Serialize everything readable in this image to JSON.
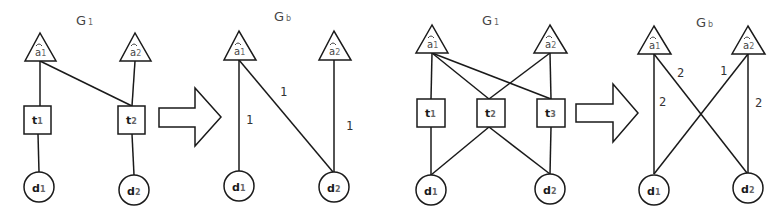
{
  "panels": [
    {
      "title": "G",
      "title_sub": "1",
      "aspects": [
        {
          "label": "a",
          "sub": "1"
        },
        {
          "label": "a",
          "sub": "2"
        }
      ],
      "terms": [
        {
          "label": "t",
          "sub": "1"
        },
        {
          "label": "t",
          "sub": "2"
        }
      ],
      "docs": [
        {
          "label": "d",
          "sub": "1"
        },
        {
          "label": "d",
          "sub": "2"
        }
      ],
      "edges": [
        [
          "a1",
          "t1"
        ],
        [
          "a1",
          "t2"
        ],
        [
          "a2",
          "t2"
        ],
        [
          "t1",
          "d1"
        ],
        [
          "t2",
          "d2"
        ]
      ]
    },
    {
      "title": "G",
      "title_sub": "b",
      "aspects": [
        {
          "label": "a",
          "sub": "1"
        },
        {
          "label": "a",
          "sub": "2"
        }
      ],
      "docs": [
        {
          "label": "d",
          "sub": "1"
        },
        {
          "label": "d",
          "sub": "2"
        }
      ],
      "edges": [
        {
          "from": "a1",
          "to": "d1",
          "weight": "1"
        },
        {
          "from": "a1",
          "to": "d2",
          "weight": "1"
        },
        {
          "from": "a2",
          "to": "d2",
          "weight": "1"
        }
      ]
    },
    {
      "title": "G",
      "title_sub": "1",
      "aspects": [
        {
          "label": "a",
          "sub": "1"
        },
        {
          "label": "a",
          "sub": "2"
        }
      ],
      "terms": [
        {
          "label": "t",
          "sub": "1"
        },
        {
          "label": "t",
          "sub": "2"
        },
        {
          "label": "t",
          "sub": "3"
        }
      ],
      "docs": [
        {
          "label": "d",
          "sub": "1"
        },
        {
          "label": "d",
          "sub": "2"
        }
      ],
      "edges": [
        [
          "a1",
          "t1"
        ],
        [
          "a1",
          "t2"
        ],
        [
          "a1",
          "t3"
        ],
        [
          "a2",
          "t2"
        ],
        [
          "a2",
          "t3"
        ],
        [
          "t1",
          "d1"
        ],
        [
          "t2",
          "d1"
        ],
        [
          "t2",
          "d2"
        ],
        [
          "t3",
          "d2"
        ]
      ]
    },
    {
      "title": "G",
      "title_sub": "b",
      "aspects": [
        {
          "label": "a",
          "sub": "1"
        },
        {
          "label": "a",
          "sub": "2"
        }
      ],
      "docs": [
        {
          "label": "d",
          "sub": "1"
        },
        {
          "label": "d",
          "sub": "2"
        }
      ],
      "edges": [
        {
          "from": "a1",
          "to": "d1",
          "weight": "2"
        },
        {
          "from": "a1",
          "to": "d2",
          "weight": "2"
        },
        {
          "from": "a2",
          "to": "d1",
          "weight": "1"
        },
        {
          "from": "a2",
          "to": "d2",
          "weight": "2"
        }
      ]
    }
  ],
  "arrows": [
    {
      "icon": "right-arrow-icon"
    },
    {
      "icon": "right-arrow-icon"
    }
  ]
}
